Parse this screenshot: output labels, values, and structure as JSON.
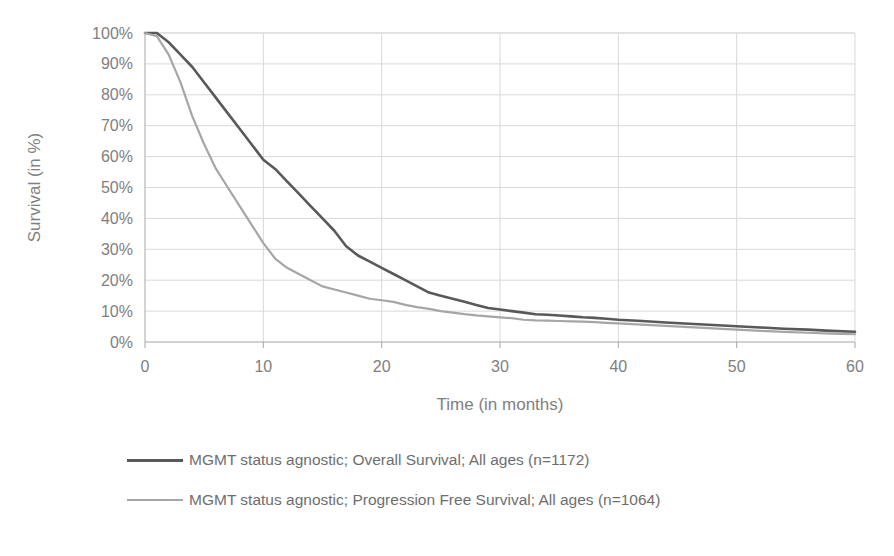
{
  "chart_data": {
    "type": "line",
    "title": "",
    "xlabel": "Time (in months)",
    "ylabel": "Survival (in %)",
    "xlim": [
      0,
      60
    ],
    "ylim": [
      0,
      100
    ],
    "xticks": [
      0,
      10,
      20,
      30,
      40,
      50,
      60
    ],
    "yticks": [
      0,
      10,
      20,
      30,
      40,
      50,
      60,
      70,
      80,
      90,
      100
    ],
    "xtick_labels": [
      "0",
      "10",
      "20",
      "30",
      "40",
      "50",
      "60"
    ],
    "ytick_labels": [
      "0%",
      "10%",
      "20%",
      "30%",
      "40%",
      "50%",
      "60%",
      "70%",
      "80%",
      "90%",
      "100%"
    ],
    "grid": "horizontal-and-vertical",
    "legend_position": "below",
    "series": [
      {
        "name": "MGMT status agnostic; Overall Survival; All ages (n=1172)",
        "color": "#595959",
        "x": [
          0,
          1,
          2,
          3,
          4,
          5,
          6,
          7,
          8,
          9,
          10,
          11,
          12,
          13,
          14,
          15,
          16,
          17,
          18,
          19,
          20,
          21,
          22,
          23,
          24,
          25,
          26,
          27,
          28,
          29,
          30,
          31,
          32,
          33,
          34,
          35,
          36,
          37,
          38,
          39,
          40,
          42,
          44,
          46,
          48,
          50,
          52,
          54,
          56,
          58,
          60
        ],
        "values": [
          100,
          100,
          97,
          93,
          89,
          84,
          79,
          74,
          69,
          64,
          59,
          56,
          52,
          48,
          44,
          40,
          36,
          31,
          28,
          26,
          24,
          22,
          20,
          18,
          16,
          15,
          14,
          13,
          12,
          11,
          10.5,
          10,
          9.5,
          9,
          8.8,
          8.6,
          8.3,
          8,
          7.8,
          7.5,
          7.2,
          6.8,
          6.3,
          5.9,
          5.5,
          5.1,
          4.7,
          4.3,
          4,
          3.6,
          3.3
        ]
      },
      {
        "name": "MGMT status agnostic; Progression Free Survival; All ages (n=1064)",
        "color": "#a6a6a6",
        "x": [
          0,
          1,
          2,
          3,
          4,
          5,
          6,
          7,
          8,
          9,
          10,
          11,
          12,
          13,
          14,
          15,
          16,
          17,
          18,
          19,
          20,
          21,
          22,
          23,
          24,
          25,
          26,
          27,
          28,
          29,
          30,
          31,
          32,
          33,
          34,
          35,
          36,
          37,
          38,
          39,
          40,
          42,
          44,
          46,
          48,
          50,
          52,
          54,
          56,
          58,
          60
        ],
        "values": [
          100,
          99,
          93,
          84,
          73,
          64,
          56,
          50,
          44,
          38,
          32,
          27,
          24,
          22,
          20,
          18,
          17,
          16,
          15,
          14,
          13.5,
          13,
          12,
          11.3,
          10.7,
          10,
          9.5,
          9,
          8.6,
          8.3,
          8,
          7.7,
          7.2,
          7,
          6.9,
          6.8,
          6.7,
          6.6,
          6.4,
          6.2,
          6,
          5.6,
          5.2,
          4.8,
          4.4,
          4,
          3.6,
          3.3,
          3,
          2.7,
          2.5
        ]
      }
    ]
  },
  "legend": {
    "entries": [
      {
        "label": "MGMT status agnostic; Overall Survival; All ages (n=1172)",
        "color": "#595959",
        "thickness": "3px"
      },
      {
        "label": "MGMT status agnostic; Progression Free Survival; All ages (n=1064)",
        "color": "#a6a6a6",
        "thickness": "2px"
      }
    ]
  },
  "colors": {
    "overall_survival": "#595959",
    "progression_free_survival": "#a6a6a6",
    "grid": "#d9d9d9",
    "axis": "#a6a6a6",
    "text": "#808080",
    "background": "#ffffff"
  }
}
